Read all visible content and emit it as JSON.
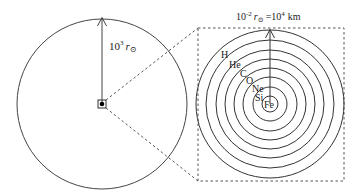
{
  "diagram": {
    "type": "stellar-onion-structure",
    "left": {
      "radius_label_base": "10",
      "radius_label_exp": "3",
      "radius_label_unit": "r",
      "radius_label_sub": "⊙"
    },
    "right": {
      "radius_label_base": "10",
      "radius_label_exp": "-2",
      "radius_label_unit": "r",
      "radius_label_sub": "⊙",
      "radius_label_equals": "=10",
      "radius_label_equals_exp": "4",
      "radius_label_equals_unit": "km",
      "shells": [
        "H",
        "He",
        "C",
        "O",
        "Ne",
        "Si",
        "Fe"
      ]
    },
    "colors": {
      "line": "#333333",
      "dashed": "#555555",
      "background": "#ffffff"
    }
  }
}
